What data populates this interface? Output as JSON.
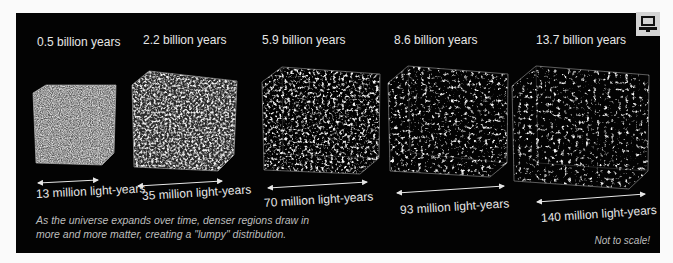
{
  "figure": {
    "panels": [
      {
        "age": "0.5 billion years",
        "size": "13 million light-years"
      },
      {
        "age": "2.2 billion years",
        "size": "35 million light-years"
      },
      {
        "age": "5.9 billion years",
        "size": "70 million light-years"
      },
      {
        "age": "8.6 billion years",
        "size": "93 million light-years"
      },
      {
        "age": "13.7 billion years",
        "size": "140 million light-years"
      }
    ],
    "caption_line1": "As the universe expands over time, denser regions draw in",
    "caption_line2": "more and more matter, creating a \"lumpy\" distribution.",
    "note": "Not to scale!"
  },
  "icons": {
    "corner": "computer-icon"
  },
  "colors": {
    "background": "#030303",
    "text": "#e6e6e6",
    "caption": "#bdbdbd",
    "page": "#fafafa"
  }
}
